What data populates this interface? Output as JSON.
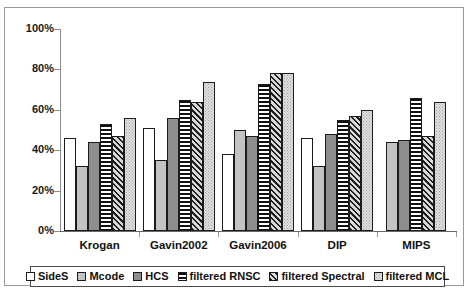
{
  "chart_data": {
    "type": "bar",
    "title": "",
    "xlabel": "",
    "ylabel": "",
    "ylim": [
      0,
      100
    ],
    "ytick_labels": [
      "100%",
      "80%",
      "60%",
      "40%",
      "20%",
      "0%"
    ],
    "ytick_values": [
      100,
      80,
      60,
      40,
      20,
      0
    ],
    "grid": false,
    "legend_position": "bottom",
    "categories": [
      "Krogan",
      "Gavin2002",
      "Gavin2006",
      "DIP",
      "MIPS"
    ],
    "series": [
      {
        "name": "SideS",
        "fill": "solid-white",
        "values": [
          46,
          51,
          38,
          46,
          null
        ]
      },
      {
        "name": "Mcode",
        "fill": "solid-lightgray",
        "values": [
          32,
          35,
          50,
          32,
          44
        ]
      },
      {
        "name": "HCS",
        "fill": "solid-darkgray",
        "values": [
          44,
          56,
          47,
          48,
          45
        ]
      },
      {
        "name": "filtered RNSC",
        "fill": "hstripe",
        "values": [
          53,
          65,
          73,
          55,
          66
        ]
      },
      {
        "name": "filtered Spectral",
        "fill": "diagonal",
        "values": [
          47,
          64,
          78,
          57,
          47
        ]
      },
      {
        "name": "filtered MCL",
        "fill": "dots",
        "values": [
          56,
          74,
          78,
          60,
          64
        ]
      }
    ]
  },
  "colors": {
    "axis": "#8d8d8d",
    "bar_outline": "#1b1b1b",
    "frame": "#9a9a9a",
    "text": "#111111"
  }
}
